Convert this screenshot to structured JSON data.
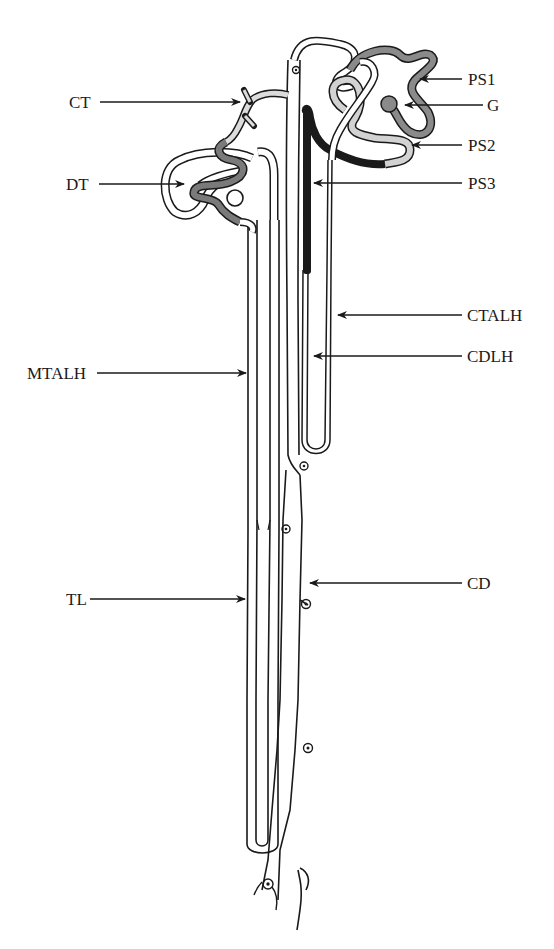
{
  "diagram": {
    "colors": {
      "line": "#1a1a1a",
      "ps1_fill": "#8a8a8a",
      "ps2_fill": "#d2d2d2",
      "ps3_fill": "#1a1a1a",
      "dt_fill": "#7a7a7a",
      "ct_fill": "#dcdcdc",
      "glomerulus_fill": "#8a8a8a",
      "background": "#ffffff"
    },
    "labels": {
      "ct": "CT",
      "dt": "DT",
      "mtalh": "MTALH",
      "tl": "TL",
      "ps1": "PS1",
      "g": "G",
      "ps2": "PS2",
      "ps3": "PS3",
      "ctalh": "CTALH",
      "cdlh": "CDLH",
      "cd": "CD"
    }
  }
}
